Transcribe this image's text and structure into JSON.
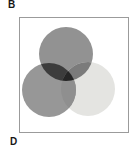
{
  "figure": {
    "panel_label_top": "B",
    "panel_label_bottom": "D",
    "background_color": "#ffffff",
    "frame_border_color": "#9b9b9b"
  },
  "venn": {
    "description": "Venn diagram of three overlapping circles inside a square framed panel",
    "circles": {
      "top": {
        "name": "top-circle",
        "color": "#929292"
      },
      "bottom_left": {
        "name": "bottom-left-circle",
        "color": "#979797"
      },
      "bottom_right": {
        "name": "bottom-right-circle",
        "color": "#e4e4e1"
      }
    },
    "overlaps": {
      "top_and_bottom_left": "#3c3c3c",
      "top_and_bottom_right": "#7b7b7b",
      "bottom_left_and_bottom_right": "#8f8f8f",
      "all_three_center": "#262626"
    }
  }
}
